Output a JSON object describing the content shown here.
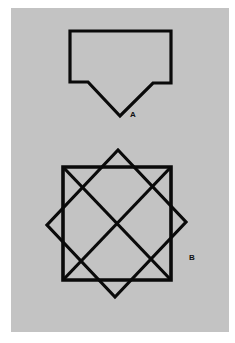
{
  "figure": {
    "background": "#c3c3c3",
    "stroke_color": "#0a0a0a",
    "stroke_width": 3.2,
    "labels": {
      "a": "A",
      "b": "B"
    },
    "shape_a": {
      "name": "pentagon-arrow",
      "points": "70,31 171,31 171,83 153,83 120,116 88,82 70,82"
    },
    "shape_b": {
      "square": "63,167 171,167 171,280 63,280",
      "diagonal_1": {
        "x1": 63,
        "y1": 167,
        "x2": 171,
        "y2": 280
      },
      "diagonal_2": {
        "x1": 63,
        "y1": 280,
        "x2": 171,
        "y2": 167
      },
      "tilted_square": "118,150 186,222 115,297 47,225"
    }
  }
}
